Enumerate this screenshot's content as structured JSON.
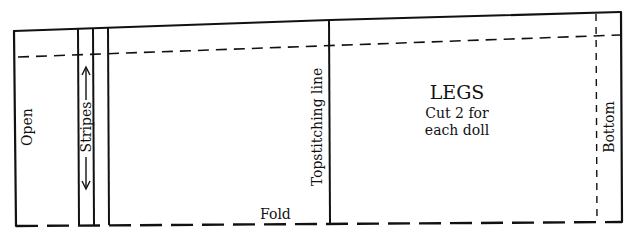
{
  "diagram": {
    "type": "sewing-pattern-piece",
    "piece_title": "LEGS",
    "instruction_line1": "Cut 2 for",
    "instruction_line2": "each doll",
    "labels": {
      "open": "Open",
      "stripes": "Stripes",
      "topstitching": "Topstitching line",
      "fold": "Fold",
      "bottom": "Bottom"
    },
    "arrows": {
      "stripes_up": "↑",
      "stripes_down": "↓"
    },
    "colors": {
      "line": "#111111",
      "background": "#ffffff"
    }
  }
}
